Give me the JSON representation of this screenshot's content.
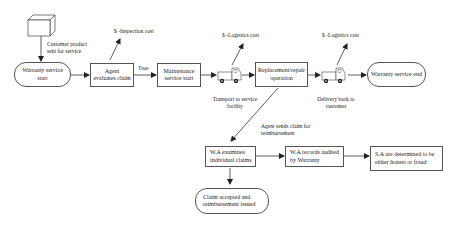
{
  "diagram": {
    "type": "flowchart",
    "title": "",
    "nodes": {
      "customer_product": {
        "label": "Customer product sent for service"
      },
      "warranty_start": {
        "label": "Warranty service start"
      },
      "agent_evaluates": {
        "label": "Agent evaluates claim"
      },
      "maintenance_start": {
        "label": "Maintenance service start"
      },
      "transport": {
        "label": "Transport to service facility"
      },
      "replacement": {
        "label": "Replacement/repair operation"
      },
      "delivery": {
        "label": "Delivery back to customer"
      },
      "warranty_end": {
        "label": "Warranty service end"
      },
      "wa_examines": {
        "label": "W.A examines individual claims"
      },
      "wa_records": {
        "label": "W.A records audited by Warranty"
      },
      "sa_determined": {
        "label": "S.A are determined to be either honest or fraud"
      },
      "claim_accepted": {
        "label": "Claim accepted and reimbursement issued"
      }
    },
    "annotations": {
      "inspection_cost": "$ -Inspection cost",
      "logistics_cost_1": "$ -Logistics cost",
      "logistics_cost_2": "$ -Logistics cost",
      "true_label": "True",
      "agent_sends_claim": "Agent sends claim for reimbursement"
    },
    "icons": {
      "package": "cube-icon",
      "transport_vehicle": "truck-icon",
      "delivery_vehicle": "truck-icon"
    },
    "edges": [
      {
        "from": "customer_product",
        "to": "warranty_start"
      },
      {
        "from": "warranty_start",
        "to": "agent_evaluates"
      },
      {
        "from": "agent_evaluates",
        "to": "maintenance_start",
        "label": "True"
      },
      {
        "from": "maintenance_start",
        "to": "transport"
      },
      {
        "from": "transport",
        "to": "replacement"
      },
      {
        "from": "replacement",
        "to": "delivery"
      },
      {
        "from": "delivery",
        "to": "warranty_end"
      },
      {
        "from": "replacement",
        "to": "wa_examines",
        "label": "Agent sends claim for reimbursement"
      },
      {
        "from": "wa_examines",
        "to": "wa_records"
      },
      {
        "from": "wa_records",
        "to": "sa_determined"
      },
      {
        "from": "wa_examines",
        "to": "claim_accepted"
      }
    ]
  }
}
